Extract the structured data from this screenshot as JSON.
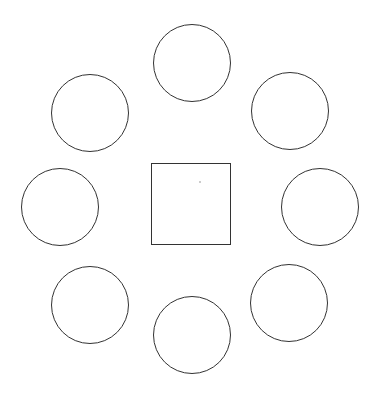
{
  "diagram": {
    "stroke_color": "#333333",
    "stroke_width": 1.5,
    "background": "#ffffff",
    "table": {
      "shape": "square",
      "x": 151,
      "y": 163,
      "width": 80,
      "height": 82
    },
    "marker": {
      "x": 200,
      "y": 182,
      "color": "#bbbbbb"
    },
    "circles": [
      {
        "id": "top",
        "cx": 192,
        "cy": 63,
        "r": 39
      },
      {
        "id": "upper-right",
        "cx": 290,
        "cy": 111,
        "r": 39
      },
      {
        "id": "right",
        "cx": 320,
        "cy": 207,
        "r": 39
      },
      {
        "id": "lower-right",
        "cx": 289,
        "cy": 303,
        "r": 39
      },
      {
        "id": "bottom",
        "cx": 192,
        "cy": 335,
        "r": 39
      },
      {
        "id": "lower-left",
        "cx": 90,
        "cy": 305,
        "r": 39
      },
      {
        "id": "left",
        "cx": 60,
        "cy": 207,
        "r": 39
      },
      {
        "id": "upper-left",
        "cx": 90,
        "cy": 113,
        "r": 39
      }
    ]
  }
}
